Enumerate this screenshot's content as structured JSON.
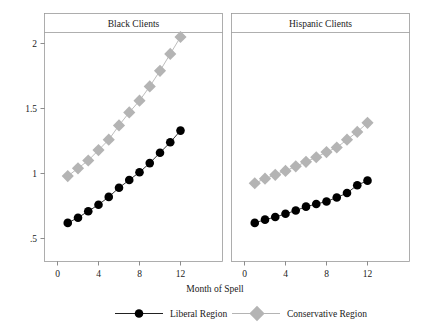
{
  "figure": {
    "background_color": "#ffffff",
    "axis_title_x": "Month of Spell",
    "panel_border_color": "#9a9a9a",
    "axis_color": "#6f6f6f"
  },
  "legend": {
    "position": "bottom",
    "entries": [
      {
        "label": "Liberal Region",
        "color": "#000000",
        "marker": "circle"
      },
      {
        "label": "Conservative Region",
        "color": "#b4b4b4",
        "marker": "diamond"
      }
    ]
  },
  "panels": [
    {
      "title": "Black Clients",
      "x_tick_labels": [
        "0",
        "4",
        "8",
        "12"
      ],
      "y_tick_labels": [
        "2",
        "1.5",
        "1",
        ".5"
      ]
    },
    {
      "title": "Hispanic Clients",
      "x_tick_labels": [
        "0",
        "4",
        "8",
        "12"
      ],
      "y_tick_labels": []
    }
  ],
  "chart_data": [
    {
      "type": "line",
      "title": "Black Clients",
      "xlabel": "Month of Spell",
      "ylabel": "",
      "x": [
        1,
        2,
        3,
        4,
        5,
        6,
        7,
        8,
        9,
        10,
        11,
        12
      ],
      "xlim": [
        0,
        13
      ],
      "ylim": [
        0.38,
        2.14
      ],
      "xticks": [
        0,
        4,
        8,
        12
      ],
      "yticks": [
        0.5,
        1,
        1.5,
        2
      ],
      "ytick_labels": [
        ".5",
        "1",
        "1.5",
        "2"
      ],
      "grid": false,
      "legend_position": "bottom",
      "series": [
        {
          "name": "Liberal Region",
          "color": "#000000",
          "marker": "circle",
          "values": [
            0.62,
            0.66,
            0.71,
            0.76,
            0.82,
            0.89,
            0.95,
            1.01,
            1.08,
            1.16,
            1.24,
            1.33
          ]
        },
        {
          "name": "Conservative Region",
          "color": "#b4b4b4",
          "marker": "diamond",
          "values": [
            0.98,
            1.04,
            1.1,
            1.18,
            1.26,
            1.37,
            1.47,
            1.56,
            1.67,
            1.79,
            1.92,
            2.05
          ]
        }
      ]
    },
    {
      "type": "line",
      "title": "Hispanic Clients",
      "xlabel": "Month of Spell",
      "ylabel": "",
      "x": [
        1,
        2,
        3,
        4,
        5,
        6,
        7,
        8,
        9,
        10,
        11,
        12
      ],
      "xlim": [
        0,
        13
      ],
      "ylim": [
        0.38,
        2.14
      ],
      "xticks": [
        0,
        4,
        8,
        12
      ],
      "yticks": [
        0.5,
        1,
        1.5,
        2
      ],
      "ytick_labels": [
        ".5",
        "1",
        "1.5",
        "2"
      ],
      "grid": false,
      "legend_position": "bottom",
      "series": [
        {
          "name": "Liberal Region",
          "color": "#000000",
          "marker": "circle",
          "values": [
            0.62,
            0.645,
            0.665,
            0.69,
            0.715,
            0.745,
            0.765,
            0.785,
            0.815,
            0.85,
            0.91,
            0.945
          ]
        },
        {
          "name": "Conservative Region",
          "color": "#b4b4b4",
          "marker": "diamond",
          "values": [
            0.925,
            0.96,
            0.99,
            1.02,
            1.055,
            1.09,
            1.125,
            1.165,
            1.2,
            1.26,
            1.32,
            1.39
          ]
        }
      ]
    }
  ]
}
